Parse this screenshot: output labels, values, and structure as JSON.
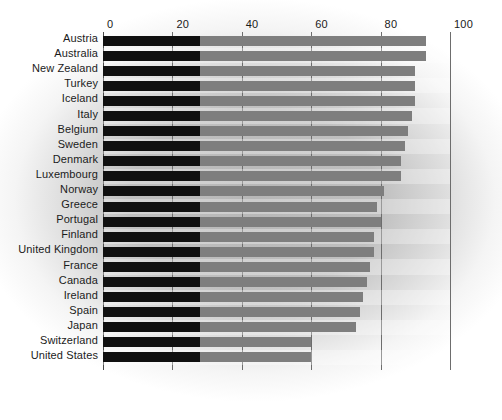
{
  "chart": {
    "type": "bar",
    "orientation": "horizontal",
    "title": "",
    "subtitle": "",
    "xlabel": "",
    "ylabel": "",
    "background_style": "radial-vignette-gray"
  },
  "axis": {
    "tick_labels": [
      "0",
      "20",
      "40",
      "60",
      "80",
      "100"
    ],
    "tick_values": [
      0,
      20,
      40,
      60,
      80,
      100
    ],
    "xlim": [
      0,
      100
    ],
    "grid": true,
    "grid_color": "#6d6d6d",
    "axis_color": "#4a4a4a"
  },
  "colors": {
    "bar": "#7e7e7e",
    "bar_highlight": "#101010",
    "text": "#1b1b1b",
    "background": "#ffffff",
    "vignette": "#aaaaaa"
  },
  "chart_data": {
    "type": "bar",
    "orientation": "horizontal",
    "title": "",
    "xlabel": "",
    "ylabel": "",
    "xlim": [
      0,
      100
    ],
    "grid": true,
    "legend": null,
    "annotations": [
      {
        "kind": "highlight-band",
        "from": 0,
        "to": 28,
        "note": "dark segment drawn from 0 to 28 on every bar"
      }
    ],
    "categories": [
      "Austria",
      "Australia",
      "New Zealand",
      "Turkey",
      "Iceland",
      "Italy",
      "Belgium",
      "Sweden",
      "Denmark",
      "Luxembourg",
      "Norway",
      "Greece",
      "Portugal",
      "Finland",
      "United Kingdom",
      "France",
      "Canada",
      "Ireland",
      "Spain",
      "Japan",
      "Switzerland",
      "United States"
    ],
    "values": [
      93,
      93,
      90,
      90,
      90,
      89,
      88,
      87,
      86,
      86,
      81,
      79,
      80,
      78,
      78,
      77,
      76,
      75,
      74,
      73,
      60,
      60
    ],
    "highlight_extent": 28
  }
}
